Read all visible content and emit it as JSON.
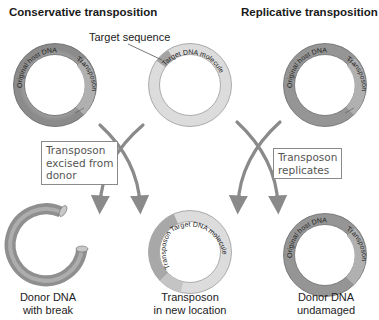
{
  "titles": {
    "left": "Conservative transposition",
    "right": "Replicative transposition"
  },
  "labels": {
    "target_sequence": "Target sequence"
  },
  "ring_labels": {
    "original_host_dna": "Original host DNA",
    "transposon": "Transposon",
    "target_dna_molecule": "Target DNA molecule"
  },
  "process_boxes": {
    "excised": [
      "Transposon",
      "excised from",
      "donor"
    ],
    "replicates": [
      "Transposon",
      "replicates"
    ]
  },
  "captions": {
    "donor_break": [
      "Donor DNA",
      "with break"
    ],
    "new_location": [
      "Transposon",
      "in new location"
    ],
    "donor_undamaged": [
      "Donor DNA",
      "undamaged"
    ]
  },
  "colors": {
    "host_ring": "#9a9a9a",
    "target_ring": "#d9d9d9",
    "transposon_segment": "#a8a8a8",
    "arrow": "#8a8a8a",
    "box_border": "#8a8a8a"
  }
}
